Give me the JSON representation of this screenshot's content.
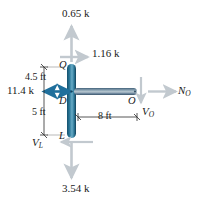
{
  "figure": {
    "name": "free-body-diagram",
    "colors": {
      "member_dark": "#1e6181",
      "member_light": "#5fa2bf",
      "member_horiz_dark": "#4c6a7d",
      "member_horiz_light": "#9fb4c0",
      "arrow_gray": "#c2c9cf",
      "arrow_blue": "#1f6f9c",
      "dim_line": "#2b2b2b",
      "text": "#1a1a1a",
      "background": "#ffffff"
    },
    "loads": {
      "top_vertical": "0.65 k",
      "top_horizontal": "1.16 k",
      "left_horizontal": "11.4 k",
      "bottom_vertical": "3.54 k"
    },
    "dimensions": {
      "upper": "4.5 ft",
      "lower": "5 ft",
      "horizontal": "8 ft"
    },
    "points": {
      "q": "Q",
      "d": "D",
      "l": "L",
      "o": "O"
    },
    "resultants": {
      "normal_o_base": "N",
      "normal_o_sub": "O",
      "shear_o_base": "V",
      "shear_o_sub": "O",
      "shear_l_base": "V",
      "shear_l_sub": "L"
    }
  }
}
